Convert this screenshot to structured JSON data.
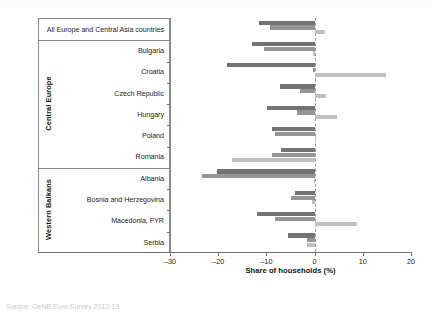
{
  "chart_data": {
    "type": "bar",
    "orientation": "horizontal",
    "title": "",
    "xlabel": "Share of households (%)",
    "ylabel": "",
    "xlim": [
      -30,
      20
    ],
    "xticks": [
      -30,
      -20,
      -10,
      0,
      10,
      20
    ],
    "xticklabels": [
      "–30",
      "–20",
      "–10",
      "0",
      "10",
      "20"
    ],
    "grid": false,
    "zero_reference_line": true,
    "legend": "none",
    "categories": [
      "All Europe and Central Asia countries",
      "Bulgaria",
      "Croatia",
      "Czech Republic",
      "Hungary",
      "Poland",
      "Romania",
      "Albania",
      "Bosnia and Herzegovina",
      "Macedonia, FYR",
      "Serbia"
    ],
    "series": [
      {
        "name": "series-1",
        "color": "#737373",
        "values": [
          -11.6,
          -13.0,
          -18.2,
          -7.2,
          -9.9,
          -8.9,
          -6.9,
          -20.2,
          -4.0,
          -12.0,
          -5.6
        ]
      },
      {
        "name": "series-2",
        "color": "#959595",
        "values": [
          -9.3,
          -10.6,
          -0.4,
          -3.1,
          -3.6,
          -8.3,
          -8.9,
          -23.4,
          -5.0,
          -8.2,
          -1.6
        ]
      },
      {
        "name": "series-3",
        "color": "#bfbfbf",
        "values": [
          2.1,
          -0.3,
          14.8,
          2.4,
          4.6,
          0.3,
          -17.2,
          -0.2,
          -0.6,
          8.8,
          -1.5
        ]
      }
    ],
    "category_bands": [
      {
        "label": "Central Europe",
        "from": "Bulgaria",
        "to": "Romania"
      },
      {
        "label": "Western Balkans",
        "from": "Albania",
        "to": "Serbia"
      }
    ]
  },
  "footer": {
    "source": "Source: OeNB Euro Survey 2012-13"
  }
}
